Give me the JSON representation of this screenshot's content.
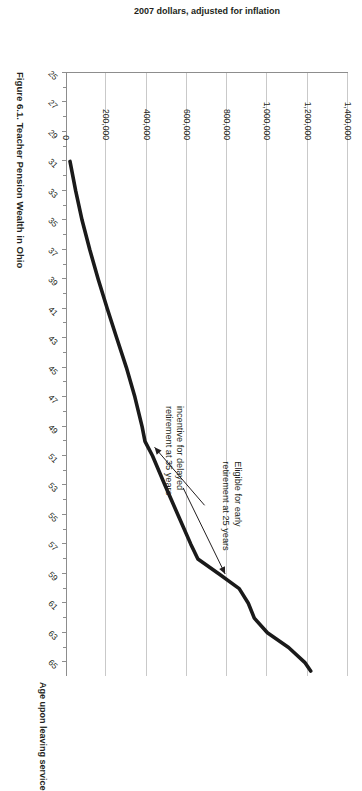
{
  "figure": {
    "caption": "Figure 6.1. Teacher Pension Wealth in Ohio"
  },
  "chart_data": {
    "type": "line",
    "title": "",
    "xlabel": "Age upon leaving service",
    "ylabel": "2007 dollars, adjusted for inflation",
    "xlim": [
      25,
      66
    ],
    "ylim": [
      0,
      1400000
    ],
    "grid": true,
    "legend": "none",
    "xtick_labels": [
      "25",
      "27",
      "29",
      "31",
      "33",
      "35",
      "37",
      "39",
      "41",
      "43",
      "45",
      "47",
      "49",
      "51",
      "53",
      "55",
      "57",
      "59",
      "61",
      "63",
      "65"
    ],
    "ytick_labels": [
      "0",
      "200,000",
      "400,000",
      "600,000",
      "800,000",
      "1,000,000",
      "1,200,000",
      "1,400,000"
    ],
    "ytick_values": [
      0,
      200000,
      400000,
      600000,
      800000,
      1000000,
      1200000,
      1400000
    ],
    "series": [
      {
        "name": "Pension wealth",
        "x": [
          31,
          33,
          35,
          37,
          39,
          41,
          43,
          45,
          47,
          49,
          50,
          51,
          53,
          55,
          57,
          58,
          59,
          60,
          61,
          62,
          63,
          64,
          65,
          65.6
        ],
        "values": [
          20000,
          48000,
          80000,
          118000,
          160000,
          205000,
          252000,
          300000,
          342000,
          378000,
          392000,
          430000,
          492000,
          556000,
          620000,
          655000,
          760000,
          860000,
          905000,
          935000,
          1000000,
          1105000,
          1185000,
          1215000
        ]
      }
    ],
    "annotations": [
      {
        "id": "delayed-retirement",
        "text_line1": "incentive for delayed",
        "text_line2": "retirement at 35 years",
        "points_to_x": 59,
        "points_to_y": 790000
      },
      {
        "id": "early-retirement",
        "text_line1": "Eligible for early",
        "text_line2": "retirement at 25 years",
        "points_to_x": 50,
        "points_to_y": 400000
      }
    ]
  }
}
